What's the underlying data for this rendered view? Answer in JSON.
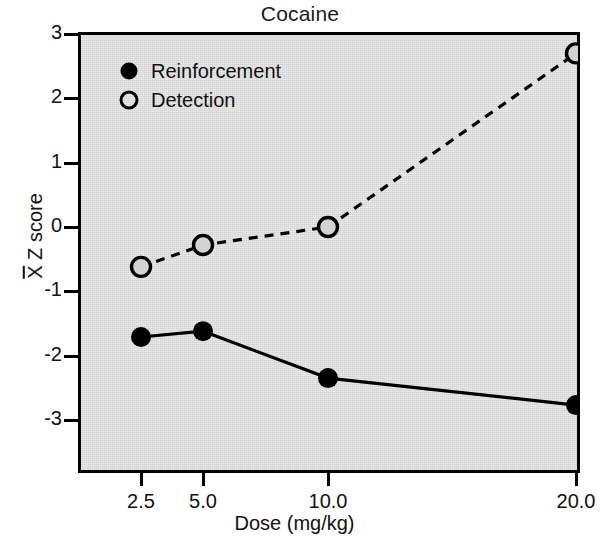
{
  "chart_data": {
    "type": "line",
    "title": "Cocaine",
    "xlabel": "Dose (mg/kg)",
    "ylabel": "X̄ Z score",
    "ylabel_symbol": "X",
    "ylabel_rest": " Z score",
    "x_scale": "log",
    "x": [
      2.5,
      5.0,
      10.0,
      20.0
    ],
    "xtick_labels": [
      "2.5",
      "5.0",
      "10.0",
      "20.0"
    ],
    "ytick_labels": [
      "3",
      "2",
      "1",
      "0",
      "-1",
      "-2",
      "-3"
    ],
    "ytick_values": [
      3,
      2,
      1,
      0,
      -1,
      -2,
      -3
    ],
    "ylim": [
      -3.4,
      3.0
    ],
    "xlim": [
      2.1,
      21.5
    ],
    "grid": false,
    "legend_position": "top-left",
    "series": [
      {
        "name": "Reinforcement",
        "marker": "filled-circle",
        "line": "solid",
        "color": "#000000",
        "values": [
          -1.71,
          -1.62,
          -2.35,
          -2.77
        ]
      },
      {
        "name": "Detection",
        "marker": "open-circle",
        "line": "dashed",
        "color": "#000000",
        "values": [
          -0.62,
          -0.28,
          0.0,
          2.7
        ]
      }
    ],
    "plot_background": "#d3d3d3",
    "axis_color": "#000000"
  }
}
